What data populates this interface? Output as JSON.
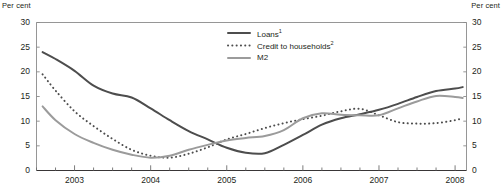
{
  "chart_data": {
    "type": "line",
    "title": "",
    "xlabel": "",
    "ylabel": "Per cent",
    "ylabel_right": "Per cent",
    "ylim": [
      0,
      30
    ],
    "xlim": [
      2002.5,
      2008.15
    ],
    "yticks": [
      30,
      25,
      20,
      15,
      10,
      5,
      0
    ],
    "xticks": [
      2003,
      2004,
      2005,
      2006,
      2007,
      2008
    ],
    "xtick_labels": [
      "2003",
      "2004",
      "2005",
      "2006",
      "2007",
      "2008"
    ],
    "ytick_labels": [
      "30",
      "25",
      "20",
      "15",
      "10",
      "5",
      "0"
    ],
    "grid": false,
    "legend_position": "top-center",
    "minor_tick_interval": 0.25,
    "series": [
      {
        "name": "Loans",
        "footnote": "1",
        "legend_label": "Loans",
        "style": "solid",
        "color": "#4d4d4d",
        "width": 2.0,
        "x": [
          2002.58,
          2002.75,
          2003.0,
          2003.25,
          2003.5,
          2003.75,
          2004.0,
          2004.25,
          2004.5,
          2004.75,
          2005.0,
          2005.25,
          2005.5,
          2005.75,
          2006.0,
          2006.25,
          2006.5,
          2006.75,
          2007.0,
          2007.25,
          2007.5,
          2007.75,
          2008.0,
          2008.1
        ],
        "values": [
          24.0,
          22.6,
          20.2,
          17.2,
          15.6,
          14.8,
          12.6,
          10.2,
          8.0,
          6.3,
          4.6,
          3.6,
          3.5,
          5.2,
          7.2,
          9.3,
          10.6,
          11.4,
          12.3,
          13.5,
          14.9,
          16.1,
          16.6,
          16.9
        ]
      },
      {
        "name": "Credit to households",
        "footnote": "2",
        "legend_label": "Credit to households",
        "style": "dotted",
        "color": "#4d4d4d",
        "width": 2.0,
        "x": [
          2002.58,
          2002.75,
          2003.0,
          2003.25,
          2003.5,
          2003.75,
          2004.0,
          2004.25,
          2004.5,
          2004.75,
          2005.0,
          2005.25,
          2005.5,
          2005.75,
          2006.0,
          2006.25,
          2006.5,
          2006.75,
          2007.0,
          2007.25,
          2007.5,
          2007.75,
          2008.0,
          2008.1
        ],
        "values": [
          19.5,
          16.2,
          12.0,
          9.0,
          6.4,
          4.2,
          3.0,
          2.6,
          3.4,
          4.7,
          6.3,
          7.4,
          8.6,
          9.6,
          10.4,
          11.1,
          12.0,
          12.5,
          11.2,
          9.8,
          9.5,
          9.6,
          10.2,
          10.6
        ]
      },
      {
        "name": "M2",
        "footnote": "",
        "legend_label": "M2",
        "style": "solid",
        "color": "#9b9b9b",
        "width": 2.0,
        "x": [
          2002.58,
          2002.75,
          2003.0,
          2003.25,
          2003.5,
          2003.75,
          2004.0,
          2004.25,
          2004.5,
          2004.75,
          2005.0,
          2005.25,
          2005.5,
          2005.75,
          2006.0,
          2006.25,
          2006.5,
          2006.75,
          2007.0,
          2007.25,
          2007.5,
          2007.75,
          2008.0,
          2008.1
        ],
        "values": [
          13.0,
          10.2,
          7.4,
          5.6,
          4.2,
          3.2,
          2.6,
          3.0,
          4.2,
          5.2,
          6.1,
          6.6,
          7.0,
          8.2,
          10.6,
          11.6,
          11.3,
          11.2,
          11.2,
          12.6,
          14.0,
          15.1,
          14.9,
          14.7
        ]
      }
    ]
  },
  "legend": {
    "items": [
      {
        "label": "Loans",
        "sup": "1"
      },
      {
        "label": "Credit to households",
        "sup": "2"
      },
      {
        "label": "M2",
        "sup": ""
      }
    ]
  }
}
